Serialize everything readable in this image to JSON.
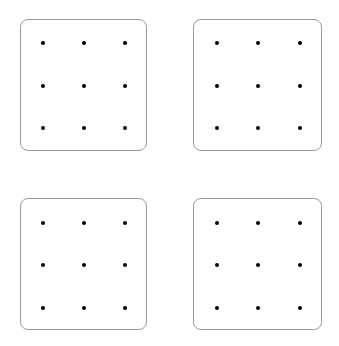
{
  "diagram": {
    "colors": {
      "border": "#9a9a9a",
      "dot": "#000000",
      "background": "#ffffff"
    },
    "panels": [
      {
        "id": "top-left",
        "x": 20,
        "y": 19,
        "w": 127,
        "h": 132,
        "rows": 3,
        "cols": 3,
        "dot_x": [
          22,
          63,
          104
        ],
        "dot_y": [
          23,
          66,
          108
        ]
      },
      {
        "id": "top-right",
        "x": 193,
        "y": 19,
        "w": 129,
        "h": 132,
        "rows": 3,
        "cols": 3,
        "dot_x": [
          23,
          64,
          106
        ],
        "dot_y": [
          23,
          66,
          108
        ]
      },
      {
        "id": "bottom-left",
        "x": 20,
        "y": 198,
        "w": 127,
        "h": 132,
        "rows": 3,
        "cols": 3,
        "dot_x": [
          22,
          63,
          104
        ],
        "dot_y": [
          24,
          66,
          109
        ]
      },
      {
        "id": "bottom-right",
        "x": 193,
        "y": 198,
        "w": 129,
        "h": 132,
        "rows": 3,
        "cols": 3,
        "dot_x": [
          23,
          64,
          106
        ],
        "dot_y": [
          24,
          66,
          109
        ]
      }
    ]
  }
}
